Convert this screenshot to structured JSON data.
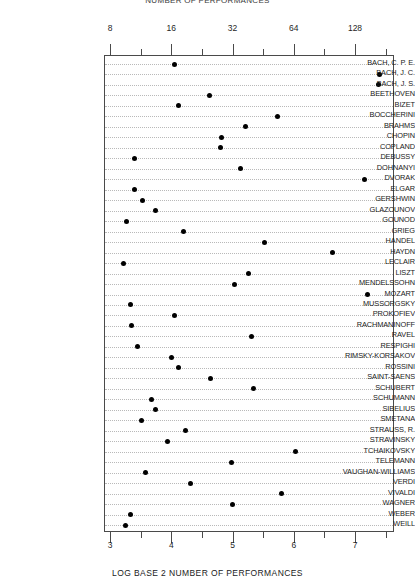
{
  "chart_data": {
    "type": "scatter",
    "title": "NUMBER OF PERFORMANCES",
    "xlabel": "LOG BASE 2 NUMBER OF PERFORMANCES",
    "ylabel": "",
    "xlim": [
      2.9,
      7.65
    ],
    "grid": true,
    "legend": null,
    "orientation": "horizontal-dotplot",
    "top_axis": {
      "label": "",
      "ticks": [
        {
          "value": 3,
          "label": "8"
        },
        {
          "value": 4,
          "label": "16"
        },
        {
          "value": 5,
          "label": "32"
        },
        {
          "value": 6,
          "label": "64"
        },
        {
          "value": 7,
          "label": "128"
        }
      ],
      "minor_ticks": [
        3.5,
        4.5,
        5.5,
        6.5,
        7.5
      ]
    },
    "bottom_axis": {
      "label": "LOG BASE 2 NUMBER OF PERFORMANCES",
      "ticks": [
        {
          "value": 3,
          "label": "3"
        },
        {
          "value": 4,
          "label": "4"
        },
        {
          "value": 5,
          "label": "5"
        },
        {
          "value": 6,
          "label": "6"
        },
        {
          "value": 7,
          "label": "7"
        }
      ],
      "minor_ticks": [
        3.5,
        4.5,
        5.5,
        6.5,
        7.5
      ]
    },
    "categories": [
      "BACH, C. P. E.",
      "BACH, J. C.",
      "BACH, J. S.",
      "BEETHOVEN",
      "BIZET",
      "BOCCHERINI",
      "BRAHMS",
      "CHOPIN",
      "COPLAND",
      "DEBUSSY",
      "DOHNANYI",
      "DVORAK",
      "ELGAR",
      "GERSHWIN",
      "GLAZOUNOV",
      "GOUNOD",
      "GRIEG",
      "HANDEL",
      "HAYDN",
      "LECLAIR",
      "LISZT",
      "MENDELSSOHN",
      "MOZART",
      "MUSSORGSKY",
      "PROKOFIEV",
      "RACHMANINOFF",
      "RAVEL",
      "RESPIGHI",
      "RIMSKY-KORSAKOV",
      "ROSSINI",
      "SAINT-SAENS",
      "SCHUBERT",
      "SCHUMANN",
      "SIBELIUS",
      "SMETANA",
      "STRAUSS, R.",
      "STRAVINSKY",
      "TCHAIKOVSKY",
      "TELEMANN",
      "VAUGHAN-WILLIAMS",
      "VERDI",
      "VIVALDI",
      "WAGNER",
      "WEBER",
      "WEILL"
    ],
    "values": [
      4.03,
      7.39,
      7.37,
      4.6,
      4.11,
      5.72,
      5.19,
      4.81,
      4.78,
      3.38,
      5.12,
      7.14,
      3.38,
      3.51,
      3.73,
      3.25,
      4.19,
      5.51,
      6.62,
      3.21,
      5.25,
      5.01,
      7.18,
      3.32,
      4.03,
      3.33,
      5.3,
      3.43,
      3.98,
      4.1,
      4.62,
      5.33,
      3.66,
      3.72,
      3.5,
      4.22,
      3.92,
      6.02,
      4.97,
      3.57,
      4.3,
      5.78,
      4.98,
      3.32,
      3.24
    ],
    "point_marker": "filled-circle",
    "point_color": "#000000"
  },
  "axis": {
    "frame_color": "#4a4a4a",
    "guide_color": "#b9b9b9"
  }
}
